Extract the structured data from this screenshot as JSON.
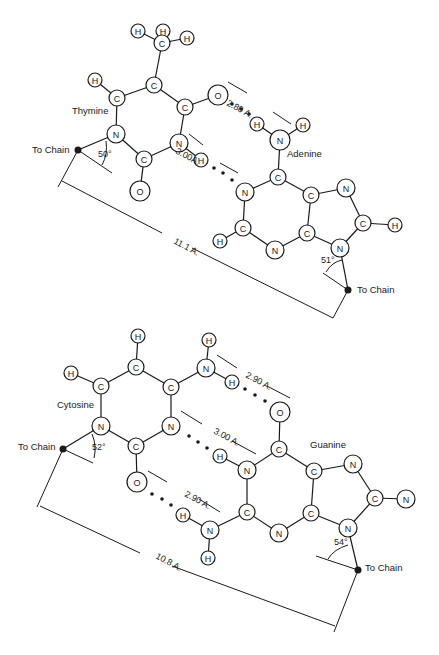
{
  "colors": {
    "ink": "#1a1a1a",
    "background": "#ffffff"
  },
  "pairs": [
    {
      "name": "thymine-adenine",
      "labels": [
        {
          "id": "thymine",
          "text": "Thymine",
          "x": 72,
          "y": 114
        },
        {
          "id": "adenine",
          "text": "Adenine",
          "x": 287,
          "y": 157
        },
        {
          "id": "chain1",
          "text": "To Chain",
          "x": 32,
          "y": 153
        },
        {
          "id": "chain2",
          "text": "To Chain",
          "x": 357,
          "y": 293
        }
      ],
      "angles": [
        {
          "text": "50°",
          "x": 98,
          "y": 157
        },
        {
          "text": "51°",
          "x": 321,
          "y": 263
        }
      ],
      "distances": [
        {
          "text": "2.80 A.",
          "x": 226,
          "y": 105,
          "rot": 28
        },
        {
          "text": "3.00A.",
          "x": 175,
          "y": 153,
          "rot": 28
        },
        {
          "text": "11.1 A.",
          "x": 173,
          "y": 243,
          "rot": 28
        }
      ],
      "atoms": [
        {
          "id": "t_h1",
          "el": "H",
          "x": 138,
          "y": 31,
          "r": 7
        },
        {
          "id": "t_h2",
          "el": "H",
          "x": 163,
          "y": 31,
          "r": 7
        },
        {
          "id": "t_h3",
          "el": "H",
          "x": 187,
          "y": 38,
          "r": 7
        },
        {
          "id": "t_cm",
          "el": "C",
          "x": 162,
          "y": 43,
          "r": 8
        },
        {
          "id": "t_c5",
          "el": "C",
          "x": 154,
          "y": 85,
          "r": 8
        },
        {
          "id": "t_h6",
          "el": "H",
          "x": 95,
          "y": 80,
          "r": 7
        },
        {
          "id": "t_c6",
          "el": "C",
          "x": 117,
          "y": 98,
          "r": 8
        },
        {
          "id": "t_c4",
          "el": "C",
          "x": 185,
          "y": 107,
          "r": 8
        },
        {
          "id": "t_o4",
          "el": "O",
          "x": 218,
          "y": 95,
          "r": 10
        },
        {
          "id": "t_n1",
          "el": "N",
          "x": 116,
          "y": 134,
          "r": 9
        },
        {
          "id": "t_n3",
          "el": "N",
          "x": 179,
          "y": 143,
          "r": 9
        },
        {
          "id": "t_c2",
          "el": "C",
          "x": 144,
          "y": 159,
          "r": 8
        },
        {
          "id": "t_o2",
          "el": "O",
          "x": 140,
          "y": 191,
          "r": 10
        },
        {
          "id": "t_h3n",
          "el": "H",
          "x": 201,
          "y": 160,
          "r": 7
        },
        {
          "id": "a_h1",
          "el": "H",
          "x": 257,
          "y": 124,
          "r": 7
        },
        {
          "id": "a_h2",
          "el": "H",
          "x": 303,
          "y": 125,
          "r": 7
        },
        {
          "id": "a_n6",
          "el": "N",
          "x": 280,
          "y": 140,
          "r": 10
        },
        {
          "id": "a_c6",
          "el": "C",
          "x": 278,
          "y": 177,
          "r": 8
        },
        {
          "id": "a_n1",
          "el": "N",
          "x": 245,
          "y": 192,
          "r": 9
        },
        {
          "id": "a_c5",
          "el": "C",
          "x": 311,
          "y": 195,
          "r": 8
        },
        {
          "id": "a_n7",
          "el": "N",
          "x": 346,
          "y": 188,
          "r": 9
        },
        {
          "id": "a_c2",
          "el": "C",
          "x": 243,
          "y": 228,
          "r": 8
        },
        {
          "id": "a_h2c",
          "el": "H",
          "x": 220,
          "y": 241,
          "r": 7
        },
        {
          "id": "a_c4",
          "el": "C",
          "x": 307,
          "y": 233,
          "r": 8
        },
        {
          "id": "a_n3",
          "el": "N",
          "x": 275,
          "y": 250,
          "r": 9
        },
        {
          "id": "a_c8",
          "el": "C",
          "x": 363,
          "y": 223,
          "r": 8
        },
        {
          "id": "a_h8",
          "el": "H",
          "x": 395,
          "y": 225,
          "r": 7
        },
        {
          "id": "a_n9",
          "el": "N",
          "x": 340,
          "y": 248,
          "r": 9
        }
      ]
    },
    {
      "name": "cytosine-guanine",
      "labels": [
        {
          "id": "cytosine",
          "text": "Cytosine",
          "x": 57,
          "y": 408
        },
        {
          "id": "guanine",
          "text": "Guanine",
          "x": 310,
          "y": 448
        },
        {
          "id": "chain3",
          "text": "To Chain",
          "x": 18,
          "y": 450
        },
        {
          "id": "chain4",
          "text": "To Chain",
          "x": 365,
          "y": 571
        }
      ],
      "angles": [
        {
          "text": "52°",
          "x": 92,
          "y": 450
        },
        {
          "text": "54°",
          "x": 334,
          "y": 545
        }
      ],
      "distances": [
        {
          "text": "2.90 A.",
          "x": 245,
          "y": 377,
          "rot": 28
        },
        {
          "text": "3.00 A.",
          "x": 213,
          "y": 433,
          "rot": 28
        },
        {
          "text": "2.90 A.",
          "x": 184,
          "y": 496,
          "rot": 28
        },
        {
          "text": "10.8 A.",
          "x": 155,
          "y": 558,
          "rot": 28
        }
      ],
      "atoms": [
        {
          "id": "c_h5",
          "el": "H",
          "x": 138,
          "y": 336,
          "r": 7
        },
        {
          "id": "c_h6",
          "el": "H",
          "x": 209,
          "y": 340,
          "r": 7
        },
        {
          "id": "c_c5",
          "el": "C",
          "x": 136,
          "y": 367,
          "r": 8
        },
        {
          "id": "c_h4",
          "el": "H",
          "x": 71,
          "y": 373,
          "r": 7
        },
        {
          "id": "c_n4",
          "el": "N",
          "x": 206,
          "y": 368,
          "r": 9
        },
        {
          "id": "c_c6",
          "el": "C",
          "x": 101,
          "y": 386,
          "r": 8
        },
        {
          "id": "c_c4",
          "el": "C",
          "x": 171,
          "y": 387,
          "r": 8
        },
        {
          "id": "c_h4b",
          "el": "H",
          "x": 232,
          "y": 382,
          "r": 7
        },
        {
          "id": "c_n1",
          "el": "N",
          "x": 101,
          "y": 426,
          "r": 9
        },
        {
          "id": "c_n3",
          "el": "N",
          "x": 171,
          "y": 426,
          "r": 9
        },
        {
          "id": "c_c2",
          "el": "C",
          "x": 136,
          "y": 446,
          "r": 8
        },
        {
          "id": "c_o2",
          "el": "O",
          "x": 137,
          "y": 482,
          "r": 10
        },
        {
          "id": "g_o6",
          "el": "O",
          "x": 280,
          "y": 412,
          "r": 10
        },
        {
          "id": "g_c6",
          "el": "C",
          "x": 279,
          "y": 449,
          "r": 8
        },
        {
          "id": "g_h1",
          "el": "H",
          "x": 220,
          "y": 456,
          "r": 7
        },
        {
          "id": "g_n1",
          "el": "N",
          "x": 247,
          "y": 470,
          "r": 9
        },
        {
          "id": "g_c5",
          "el": "C",
          "x": 314,
          "y": 471,
          "r": 8
        },
        {
          "id": "g_n7",
          "el": "N",
          "x": 353,
          "y": 464,
          "r": 9
        },
        {
          "id": "g_h2a",
          "el": "H",
          "x": 183,
          "y": 515,
          "r": 7
        },
        {
          "id": "g_c2",
          "el": "C",
          "x": 247,
          "y": 512,
          "r": 8
        },
        {
          "id": "g_n2",
          "el": "N",
          "x": 210,
          "y": 530,
          "r": 9
        },
        {
          "id": "g_c4",
          "el": "C",
          "x": 311,
          "y": 513,
          "r": 8
        },
        {
          "id": "g_c8",
          "el": "C",
          "x": 375,
          "y": 498,
          "r": 8
        },
        {
          "id": "g_n8",
          "el": "N",
          "x": 406,
          "y": 499,
          "r": 9
        },
        {
          "id": "g_n3",
          "el": "N",
          "x": 279,
          "y": 533,
          "r": 9
        },
        {
          "id": "g_n9",
          "el": "N",
          "x": 348,
          "y": 528,
          "r": 9
        },
        {
          "id": "g_h2b",
          "el": "H",
          "x": 208,
          "y": 558,
          "r": 7
        }
      ]
    }
  ]
}
